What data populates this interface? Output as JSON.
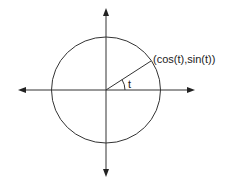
{
  "diagram": {
    "point_label": "(cos(t),sin(t))",
    "angle_label": "t",
    "colors": {
      "stroke": "#333333",
      "background": "#ffffff"
    }
  }
}
